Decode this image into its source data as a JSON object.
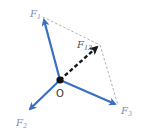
{
  "diagram": {
    "type": "force-vector-diagram",
    "origin": {
      "label": "O",
      "x": 60,
      "y": 80
    },
    "colors": {
      "force_vector": "#3a6fc4",
      "resultant_vector": "#1a1a1a",
      "construction_lines": "#9a9a9a",
      "label_text": "#7a8fb8",
      "origin_text": "#333333"
    },
    "forces": [
      {
        "id": "F1",
        "main": "F",
        "sub": "1",
        "tip": [
          43,
          17
        ],
        "label_pos": [
          30,
          17
        ]
      },
      {
        "id": "F2",
        "main": "F",
        "sub": "2",
        "tip": [
          28,
          111
        ],
        "label_pos": [
          16,
          126
        ]
      },
      {
        "id": "F3",
        "main": "F",
        "sub": "3",
        "tip": [
          118,
          105
        ],
        "label_pos": [
          121,
          114
        ]
      }
    ],
    "resultant": {
      "id": "F13",
      "main": "F",
      "sub": "13",
      "tip": [
        100,
        45
      ],
      "label_pos": [
        77,
        48
      ],
      "style": "dashed"
    },
    "construction": [
      {
        "from": [
          43,
          17
        ],
        "to": [
          100,
          45
        ]
      },
      {
        "from": [
          100,
          45
        ],
        "to": [
          118,
          105
        ]
      }
    ]
  }
}
